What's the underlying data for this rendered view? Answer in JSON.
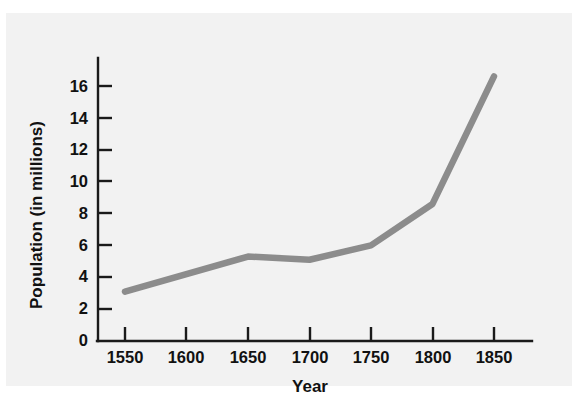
{
  "figure": {
    "background_color": "#ffffff",
    "panel_color": "#f2f2f2",
    "axis_color": "#1a1a1a",
    "line_color": "#8c8c8c"
  },
  "chart_data": {
    "type": "line",
    "title": "",
    "xlabel": "Year",
    "ylabel": "Population (in millions)",
    "x": [
      1550,
      1650,
      1700,
      1750,
      1800,
      1850
    ],
    "values": [
      3.1,
      5.3,
      5.1,
      6.0,
      8.6,
      16.6
    ],
    "series": [
      {
        "name": "Population",
        "x": [
          1550,
          1650,
          1700,
          1750,
          1800,
          1850
        ],
        "values": [
          3.1,
          5.3,
          5.1,
          6.0,
          8.6,
          16.6
        ]
      }
    ],
    "xlim": [
      1527,
      1880
    ],
    "ylim": [
      0,
      17.3
    ],
    "xticks": [
      1550,
      1600,
      1650,
      1700,
      1750,
      1800,
      1850
    ],
    "xtick_labels": [
      "1550",
      "1600",
      "1650",
      "1700",
      "1750",
      "1800",
      "1850"
    ],
    "yticks": [
      0,
      2,
      4,
      6,
      8,
      10,
      12,
      14,
      16
    ],
    "ytick_labels": [
      "0",
      "2",
      "4",
      "6",
      "8",
      "10",
      "12",
      "14",
      "16"
    ],
    "grid": false,
    "legend": false,
    "legend_position": "none",
    "annotations": []
  }
}
